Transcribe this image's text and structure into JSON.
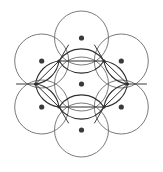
{
  "figure": {
    "canvas": {
      "width": 163,
      "height": 172,
      "background_color": "#ffffff"
    },
    "style": {
      "circle_stroke_color": "#6b6b6b",
      "circle_stroke_width": 0.9,
      "circle_fill": "none",
      "overlap_stroke_color": "#2e2e2e",
      "overlap_stroke_width": 1.1,
      "center_dot_color": "#3a3a3a",
      "center_dot_radius": 2.6,
      "vertex_node_color": "#2e2e2e",
      "vertex_node_radius": 1.6
    },
    "geometry": {
      "circle_radius": 27,
      "center_spacing": 46,
      "hexagon_circumradius": 46,
      "lens_half_width": 23,
      "count_circles": 7,
      "count_center_dots": 7,
      "count_hexagon_vertices": 6
    },
    "circles": [
      {
        "id": "circle-center",
        "label": "center",
        "cx": 81.5,
        "cy": 84.0,
        "r": 27
      },
      {
        "id": "circle-top",
        "label": "top",
        "cx": 81.5,
        "cy": 38.0,
        "r": 27
      },
      {
        "id": "circle-upper-right",
        "label": "upper-right",
        "cx": 121.3,
        "cy": 61.0,
        "r": 27
      },
      {
        "id": "circle-lower-right",
        "label": "lower-right",
        "cx": 121.3,
        "cy": 107.0,
        "r": 27
      },
      {
        "id": "circle-bottom",
        "label": "bottom",
        "cx": 81.5,
        "cy": 130.0,
        "r": 27
      },
      {
        "id": "circle-lower-left",
        "label": "lower-left",
        "cx": 41.7,
        "cy": 107.0,
        "r": 27
      },
      {
        "id": "circle-upper-left",
        "label": "upper-left",
        "cx": 41.7,
        "cy": 61.0,
        "r": 27
      }
    ],
    "center_dots": [
      {
        "id": "dot-center",
        "cx": 81.5,
        "cy": 84.0
      },
      {
        "id": "dot-top",
        "cx": 81.5,
        "cy": 38.0
      },
      {
        "id": "dot-upper-right",
        "cx": 121.3,
        "cy": 61.0
      },
      {
        "id": "dot-lower-right",
        "cx": 121.3,
        "cy": 107.0
      },
      {
        "id": "dot-bottom",
        "cx": 81.5,
        "cy": 130.0
      },
      {
        "id": "dot-lower-left",
        "cx": 41.7,
        "cy": 107.0
      },
      {
        "id": "dot-upper-left",
        "cx": 41.7,
        "cy": 61.0
      }
    ],
    "hexagon_vertices": [
      {
        "id": "vertex-top-right",
        "cx": 104.0,
        "cy": 61.0
      },
      {
        "id": "vertex-right",
        "cx": 127.5,
        "cy": 84.0
      },
      {
        "id": "vertex-bottom-right",
        "cx": 104.0,
        "cy": 107.0
      },
      {
        "id": "vertex-bottom-left",
        "cx": 59.0,
        "cy": 107.0
      },
      {
        "id": "vertex-left",
        "cx": 35.5,
        "cy": 84.0
      },
      {
        "id": "vertex-top-left",
        "cx": 59.0,
        "cy": 61.0
      }
    ]
  }
}
